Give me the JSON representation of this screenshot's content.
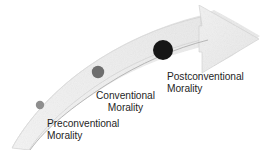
{
  "figure": {
    "background_color": "#ffffff",
    "title_visible": false
  },
  "arrow": {
    "name": "ascending-curved-arrow",
    "direction": "up-right",
    "fill_color": "#eeeeee",
    "edge_color": "#b9b9b9",
    "shadow_line_color": "#a9a9a9"
  },
  "stages": [
    {
      "id": "preconventional",
      "line1": "Preconventional",
      "line2": "Morality",
      "marker_color": "#8e8e8e",
      "marker_radius": 4.2,
      "marker_cx": 40,
      "marker_cy": 105,
      "align": "left"
    },
    {
      "id": "conventional",
      "line1": "Conventional",
      "line2": "Morality",
      "marker_color": "#6e6e6e",
      "marker_radius": 6.2,
      "marker_cx": 98,
      "marker_cy": 72,
      "align": "center"
    },
    {
      "id": "postconventional",
      "line1": "Postconventional",
      "line2": "Morality",
      "marker_color": "#161616",
      "marker_radius": 10.0,
      "marker_cx": 163,
      "marker_cy": 50,
      "align": "left"
    }
  ],
  "text": {
    "color": "#1f1f1f"
  }
}
